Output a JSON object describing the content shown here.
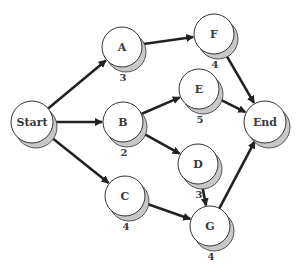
{
  "diagram": {
    "type": "network (activity-on-node / PERT)",
    "colors": {
      "background": "#ffffff",
      "node_fill": "#ffffff",
      "node_stroke": "#333333",
      "shadow": "#c8c8c8",
      "edge": "#222222",
      "text": "#3a3a3a"
    },
    "nodes": [
      {
        "id": "Start",
        "label": "Start",
        "duration": "",
        "x": 32,
        "y": 122,
        "r": 21
      },
      {
        "id": "A",
        "label": "A",
        "duration": "3",
        "x": 122,
        "y": 47,
        "r": 20
      },
      {
        "id": "B",
        "label": "B",
        "duration": "2",
        "x": 123,
        "y": 122,
        "r": 20
      },
      {
        "id": "C",
        "label": "C",
        "duration": "4",
        "x": 125,
        "y": 196,
        "r": 20
      },
      {
        "id": "F",
        "label": "F",
        "duration": "4",
        "x": 214,
        "y": 34,
        "r": 20
      },
      {
        "id": "E",
        "label": "E",
        "duration": "5",
        "x": 199,
        "y": 89,
        "r": 20
      },
      {
        "id": "D",
        "label": "D",
        "duration": "3",
        "x": 198,
        "y": 164,
        "r": 20
      },
      {
        "id": "G",
        "label": "G",
        "duration": "4",
        "x": 210,
        "y": 226,
        "r": 20
      },
      {
        "id": "End",
        "label": "End",
        "duration": "",
        "x": 265,
        "y": 122,
        "r": 21
      }
    ],
    "edges": [
      {
        "from": "Start",
        "to": "A"
      },
      {
        "from": "Start",
        "to": "B"
      },
      {
        "from": "Start",
        "to": "C"
      },
      {
        "from": "A",
        "to": "F"
      },
      {
        "from": "B",
        "to": "E"
      },
      {
        "from": "B",
        "to": "D"
      },
      {
        "from": "C",
        "to": "G"
      },
      {
        "from": "D",
        "to": "G"
      },
      {
        "from": "F",
        "to": "End"
      },
      {
        "from": "E",
        "to": "End"
      },
      {
        "from": "G",
        "to": "End"
      }
    ]
  }
}
